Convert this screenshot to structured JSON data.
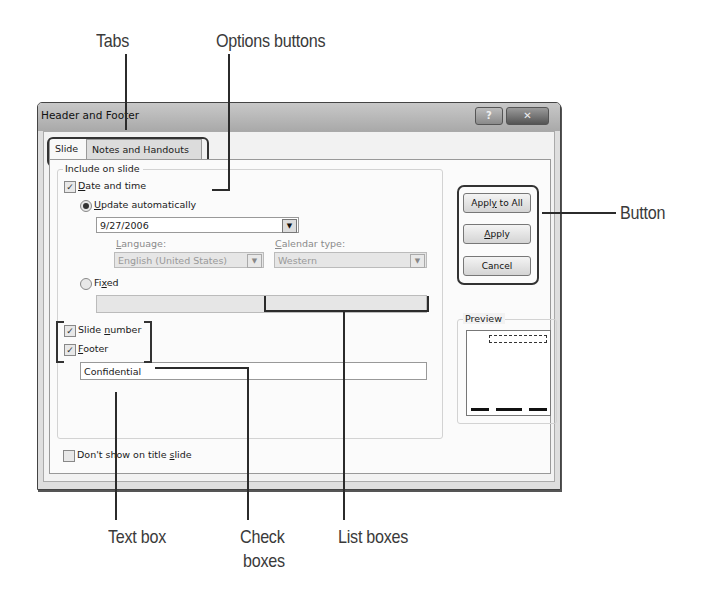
{
  "callouts": {
    "tabs": "Tabs",
    "options_buttons": "Options buttons",
    "button": "Button",
    "text_box": "Text box",
    "check_boxes_line1": "Check",
    "check_boxes_line2": "boxes",
    "list_boxes": "List boxes"
  },
  "dialog": {
    "title": "Header and Footer",
    "help_icon": "?",
    "close_icon": "✕",
    "tabs": [
      {
        "label": "Slide",
        "active": true
      },
      {
        "label": "Notes and Handouts",
        "active": false
      }
    ],
    "include_group": {
      "legend": "Include on slide",
      "date_and_time": {
        "label_pre": "",
        "label_u": "D",
        "label_post": "ate and time",
        "checked": true
      },
      "update_automatically": {
        "label_u": "U",
        "label_post": "pdate automatically",
        "selected": true
      },
      "date_value": "9/27/2006",
      "language": {
        "label_u": "L",
        "label_post": "anguage:",
        "value": "English (United States)"
      },
      "calendar_type": {
        "label_u": "C",
        "label_post": "alendar type:",
        "value": "Western"
      },
      "fixed": {
        "label_pre": "Fi",
        "label_u": "x",
        "label_post": "ed",
        "selected": false,
        "value": ""
      },
      "slide_number": {
        "label_pre": "Slide ",
        "label_u": "n",
        "label_post": "umber",
        "checked": true
      },
      "footer": {
        "label_u": "F",
        "label_post": "ooter",
        "checked": true,
        "value": "Confidential"
      }
    },
    "dont_show_title": {
      "label_pre": "Don't show on title ",
      "label_u": "s",
      "label_post": "lide",
      "checked": false
    },
    "buttons": {
      "apply_all": {
        "pre": "Appl",
        "u": "y",
        "post": " to All"
      },
      "apply": {
        "pre": "",
        "u": "A",
        "post": "pply"
      },
      "cancel": "Cancel"
    },
    "preview": {
      "legend": "Preview"
    },
    "check_mark": "✓",
    "dropdown_arrow": "▼"
  }
}
